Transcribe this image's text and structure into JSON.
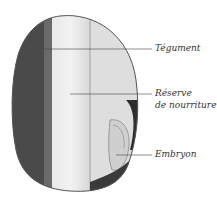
{
  "diagram": {
    "labels": [
      {
        "id": "tegument",
        "text": "Tégument"
      },
      {
        "id": "reserve",
        "line1": "Réserve",
        "line2": "de nourriture"
      },
      {
        "id": "embryon",
        "text": "Embryon"
      }
    ]
  }
}
